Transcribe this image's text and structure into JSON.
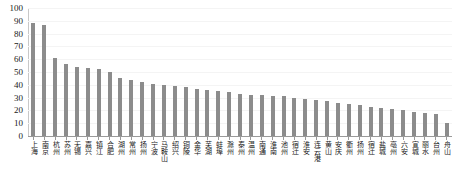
{
  "chart_data": {
    "type": "bar",
    "title": "",
    "xlabel": "",
    "ylabel": "",
    "ylim": [
      0,
      100
    ],
    "yticks": [
      0,
      10,
      20,
      30,
      40,
      50,
      60,
      70,
      80,
      90,
      100
    ],
    "grid": true,
    "legend": "none",
    "bar_color": "#8c8c8c",
    "categories": [
      "上海",
      "南京",
      "杭州",
      "苏州",
      "无锡",
      "嘉兴",
      "镇江",
      "合肥",
      "湖州",
      "常州",
      "扬州",
      "宁波",
      "马鞍山",
      "绍兴",
      "铜陵",
      "金华",
      "芜湖",
      "蚌埠",
      "滁州",
      "泰州",
      "温州",
      "南通",
      "淮南",
      "池州",
      "宿迁",
      "淮安",
      "连云港",
      "黄山",
      "安庆",
      "衢州",
      "扬州",
      "宿迁",
      "盐城",
      "亳州",
      "六安",
      "宣城",
      "丽水",
      "台州",
      "舟山"
    ],
    "values": [
      88,
      87,
      61,
      56,
      54,
      53,
      52,
      50,
      45,
      44,
      42,
      41,
      40,
      39,
      38,
      37,
      36,
      35,
      34,
      33,
      32,
      32,
      31,
      31,
      30,
      29,
      28,
      27,
      26,
      25,
      24,
      23,
      22,
      21,
      20,
      19,
      18,
      17,
      10
    ]
  }
}
